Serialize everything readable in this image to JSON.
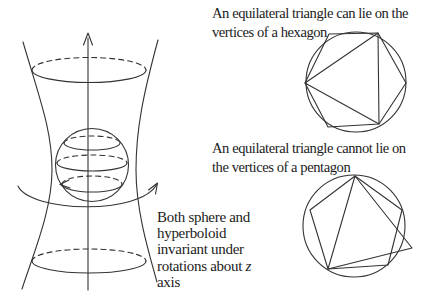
{
  "captions": {
    "hexagon": {
      "line1": "An equilateral triangle can lie on the",
      "line2": "vertices of a hexagon"
    },
    "pentagon": {
      "line1": "An equilateral triangle cannot lie on",
      "line2": "the vertices of a pentagon"
    },
    "invariance": {
      "line1": "Both sphere and",
      "line2": "hyperboloid",
      "line3": "invariant under",
      "line4_prefix": "rotations about ",
      "line4_var": "z",
      "line5": "axis"
    }
  },
  "figures": {
    "hexagon_demo": {
      "circle": {
        "cx": 356,
        "cy": 82,
        "r": 50
      },
      "hexagon_points": "329,34 378,33 406,83 379,124 328,127 305,83",
      "triangle_points": "305,83 378,33 379,124"
    },
    "pentagon_demo": {
      "circle": {
        "cx": 354,
        "cy": 226,
        "r": 51
      },
      "pentagon_points": "355,176 310,210 328,269 388,265 402,210",
      "triangle_points": "355,176 328,269 412,248"
    }
  },
  "colors": {
    "stroke": "#333333",
    "text": "#1c1c1c",
    "background": "#ffffff"
  }
}
